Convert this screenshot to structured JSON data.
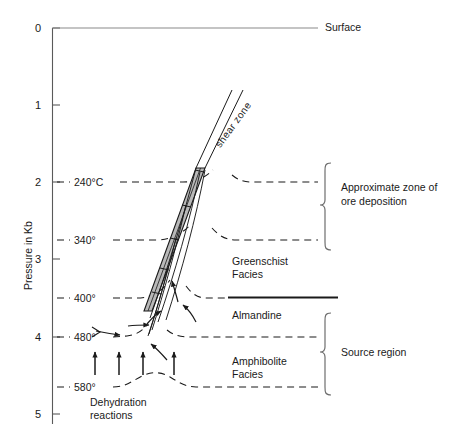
{
  "figure": {
    "type": "diagram",
    "domain": "geology-pressure-temperature-section",
    "background_color": "#ffffff",
    "ink_color": "#1a1a1a",
    "shear_zone_fill": "#b9b9b9"
  },
  "axis": {
    "label": "Pressure in Kb",
    "unit": "Kb",
    "ticks": [
      "0",
      "1",
      "2",
      "3",
      "4",
      "5"
    ],
    "tick_values": [
      0,
      1,
      2,
      3,
      4,
      5
    ],
    "min": 0,
    "max": 5
  },
  "isotherms": [
    {
      "label": "240°C",
      "value": 240,
      "pressure": 2.0
    },
    {
      "label": "340°",
      "value": 340,
      "pressure": 2.75
    },
    {
      "label": "400°",
      "value": 400,
      "pressure": 3.5
    },
    {
      "label": "480°",
      "value": 480,
      "pressure": 4.0
    },
    {
      "label": "580°",
      "value": 580,
      "pressure": 4.65
    }
  ],
  "annotations": {
    "surface": "Surface",
    "shear_zone": "shear zone",
    "dehydration": "Dehydration\nreactions",
    "dehydration_line1": "Dehydration",
    "dehydration_line2": "reactions"
  },
  "facies": [
    {
      "name": "Greenschist\nFacies",
      "line1": "Greenschist",
      "line2": "Facies"
    },
    {
      "name": "Almandine",
      "line1": "Almandine",
      "line2": ""
    },
    {
      "name": "Amphibolite\nFacies",
      "line1": "Amphibolite",
      "line2": "Facies"
    }
  ],
  "brackets": [
    {
      "label": "Approximate zone of\nore deposition",
      "line1": "Approximate zone of",
      "line2": "ore deposition",
      "from_pressure": 2.0,
      "to_pressure": 2.75
    },
    {
      "label": "Source region",
      "line1": "Source region",
      "line2": "",
      "from_pressure": 3.7,
      "to_pressure": 4.65
    }
  ],
  "flow_arrows": {
    "count": 4,
    "direction": "upward",
    "meaning": "dehydration fluid flux"
  }
}
